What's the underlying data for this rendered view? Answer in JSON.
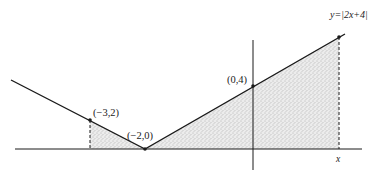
{
  "diagram": {
    "function_label": "y=|2x+4|",
    "points": [
      {
        "label": "(−3,2)",
        "x": -3,
        "y": 2
      },
      {
        "label": "(−2,0)",
        "x": -2,
        "y": 0
      },
      {
        "label": "(0,4)",
        "x": 0,
        "y": 4
      }
    ],
    "x_marker_label": "x",
    "shaded_region": "area under y=|2x+4| from x=-3 to x",
    "colors": {
      "line": "#1a1a1a",
      "shade": "#d9d9d9",
      "background": "#ffffff"
    }
  }
}
